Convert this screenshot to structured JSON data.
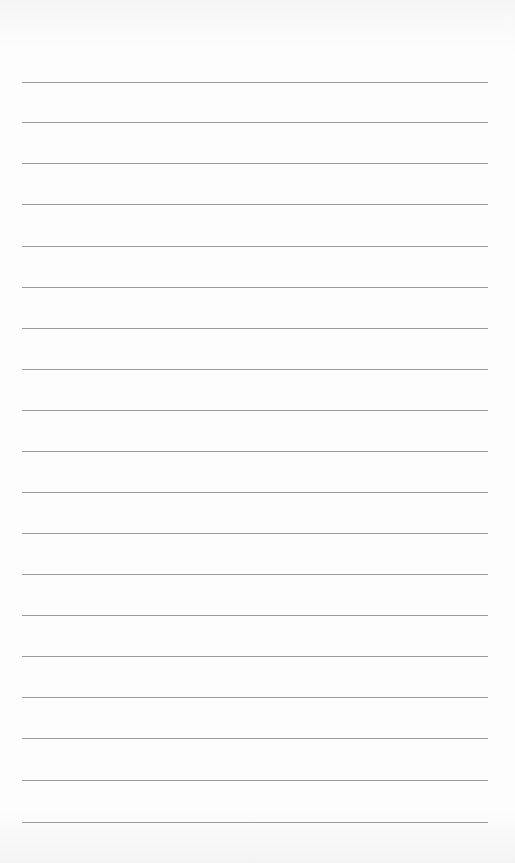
{
  "page": {
    "type": "lined-paper",
    "background_color": "#fdfdfd",
    "rule_color": "#9a9a9a",
    "rules": {
      "count": 19,
      "left": 22,
      "width": 466,
      "positions_y": [
        82,
        122,
        163,
        204,
        246,
        287,
        328,
        369,
        410,
        451,
        492,
        533,
        574,
        615,
        656,
        697,
        738,
        780,
        822
      ]
    },
    "text": ""
  }
}
